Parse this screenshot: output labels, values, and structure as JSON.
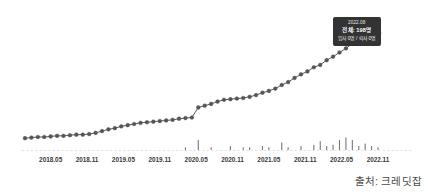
{
  "source_note": "출처: 크레딧잡",
  "tooltip": {
    "date": "2022.08",
    "total": "전체: 198명",
    "flow": "입사 0명 / 퇴사 0명",
    "bg_color": "#333333",
    "text_color": "#ffffff"
  },
  "chart_data": {
    "type": "line",
    "title": "",
    "subtitle": "",
    "xlabel": "",
    "ylabel": "",
    "grid": false,
    "legend": "none",
    "marker": "circle",
    "line_color": "#444444",
    "marker_color": "#555555",
    "bar_color": "#777777",
    "axis_color": "#cccccc",
    "ylim": [
      0,
      210
    ],
    "tick_labels": [
      "2018.05",
      "2018.11",
      "2019.05",
      "2019.11",
      "2020.05",
      "2020.11",
      "2021.05",
      "2021.11",
      "2022.05",
      "2022.11"
    ],
    "x": [
      "2018.01",
      "2018.02",
      "2018.03",
      "2018.04",
      "2018.05",
      "2018.06",
      "2018.07",
      "2018.08",
      "2018.09",
      "2018.10",
      "2018.11",
      "2018.12",
      "2019.01",
      "2019.02",
      "2019.03",
      "2019.04",
      "2019.05",
      "2019.06",
      "2019.07",
      "2019.08",
      "2019.09",
      "2019.10",
      "2019.11",
      "2019.12",
      "2020.01",
      "2020.02",
      "2020.03",
      "2020.04",
      "2020.05",
      "2020.06",
      "2020.07",
      "2020.08",
      "2020.09",
      "2020.10",
      "2020.11",
      "2020.12",
      "2021.01",
      "2021.02",
      "2021.03",
      "2021.04",
      "2021.05",
      "2021.06",
      "2021.07",
      "2021.08",
      "2021.09",
      "2021.10",
      "2021.11",
      "2021.12",
      "2022.01",
      "2022.02",
      "2022.03",
      "2022.04",
      "2022.05",
      "2022.06",
      "2022.07",
      "2022.08"
    ],
    "series": [
      {
        "name": "전체",
        "values": [
          20,
          21,
          22,
          22,
          23,
          24,
          24,
          25,
          26,
          26,
          27,
          29,
          32,
          35,
          37,
          40,
          42,
          44,
          46,
          47,
          48,
          49,
          50,
          51,
          53,
          54,
          55,
          72,
          75,
          78,
          82,
          85,
          86,
          87,
          88,
          90,
          93,
          97,
          100,
          104,
          110,
          115,
          122,
          128,
          133,
          140,
          144,
          152,
          158,
          165,
          172,
          180,
          186,
          190,
          194,
          198
        ]
      }
    ],
    "bars": {
      "name": "월별 입퇴사",
      "values": [
        0,
        0,
        0,
        0,
        0,
        0,
        0,
        0,
        0,
        0,
        0,
        0,
        0,
        0,
        0,
        0,
        0,
        0,
        0,
        0,
        0,
        0,
        0,
        0,
        0,
        1,
        0,
        7,
        0,
        1,
        0,
        0,
        2,
        0,
        1,
        1,
        0,
        2,
        1,
        0,
        5,
        1,
        0,
        2,
        0,
        3,
        6,
        2,
        3,
        7,
        9,
        7,
        2,
        4,
        2,
        1
      ]
    }
  }
}
